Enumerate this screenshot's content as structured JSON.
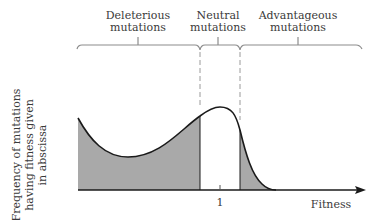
{
  "categories": {
    "deleterious": {
      "line1": "Deleterious",
      "line2": "mutations"
    },
    "neutral": {
      "line1": "Neutral",
      "line2": "mutations"
    },
    "advantageous": {
      "line1": "Advantageous",
      "line2": "mutations"
    }
  },
  "axes": {
    "y_label_line1": "Frequency of mutations",
    "y_label_line2": "having fitness given",
    "y_label_line3": "in abscissa",
    "x_label": "Fitness",
    "x_tick": "1"
  },
  "colors": {
    "shade": "#a9a9a9",
    "curve": "#1a1a1a",
    "bracket": "#8c8c8c",
    "dash": "#9a9a9a"
  }
}
